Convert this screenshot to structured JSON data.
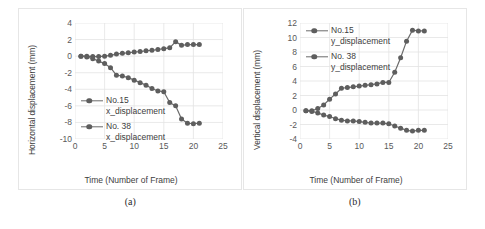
{
  "figure": {
    "captions": [
      "(a)",
      "(b)"
    ]
  },
  "chart_data": [
    {
      "type": "scatter",
      "panel": "a",
      "title": "",
      "xlabel": "Time (Number of Frame)",
      "ylabel": "Horizontal displacement (mm)",
      "xlim": [
        0,
        25
      ],
      "ylim": [
        -10,
        4
      ],
      "xticks": [
        0,
        5,
        10,
        15,
        20,
        25
      ],
      "yticks": [
        4,
        2,
        0,
        -2,
        -4,
        -6,
        -8,
        -10
      ],
      "grid": true,
      "legend_position": "inside-left",
      "marker": "circle",
      "line_color": "#6b6b6b",
      "marker_color": "#5e5e5e",
      "x": [
        1,
        2,
        3,
        4,
        5,
        6,
        7,
        8,
        9,
        10,
        11,
        12,
        13,
        14,
        15,
        16,
        17,
        18,
        19,
        20,
        21
      ],
      "series": [
        {
          "name": "No.15 x_displacement",
          "label_line1": "No.15",
          "label_line2": "x_displacement",
          "values": [
            0.0,
            0.0,
            -0.05,
            -0.05,
            0.0,
            0.1,
            0.25,
            0.35,
            0.4,
            0.5,
            0.55,
            0.65,
            0.7,
            0.8,
            0.9,
            1.0,
            1.75,
            1.3,
            1.4,
            1.4,
            1.4
          ]
        },
        {
          "name": "No. 38 x_displacement",
          "label_line1": "No. 38",
          "label_line2": "x_displacement",
          "values": [
            0.0,
            -0.1,
            -0.3,
            -0.6,
            -0.9,
            -1.4,
            -2.3,
            -2.4,
            -2.6,
            -2.9,
            -3.2,
            -3.5,
            -3.9,
            -4.2,
            -4.3,
            -5.6,
            -6.0,
            -7.6,
            -8.1,
            -8.15,
            -8.1
          ]
        }
      ]
    },
    {
      "type": "scatter",
      "panel": "b",
      "title": "",
      "xlabel": "Time (Number of Frame)",
      "ylabel": "Vertical displacement (mm)",
      "xlim": [
        0,
        25
      ],
      "ylim": [
        -4,
        12
      ],
      "xticks": [
        0,
        5,
        10,
        15,
        20,
        25
      ],
      "yticks": [
        12,
        10,
        8,
        6,
        4,
        2,
        0,
        -2,
        -4
      ],
      "grid": true,
      "legend_position": "inside-left",
      "marker": "circle",
      "line_color": "#6b6b6b",
      "marker_color": "#5e5e5e",
      "x": [
        1,
        2,
        3,
        4,
        5,
        6,
        7,
        8,
        9,
        10,
        11,
        12,
        13,
        14,
        15,
        16,
        17,
        18,
        19,
        20,
        21
      ],
      "series": [
        {
          "name": "No.15 y_displacement",
          "label_line1": "No.15",
          "label_line2": "y_displacement",
          "values": [
            -0.1,
            -0.1,
            0.2,
            0.7,
            1.5,
            2.2,
            3.0,
            3.1,
            3.2,
            3.3,
            3.4,
            3.5,
            3.6,
            3.8,
            3.8,
            5.2,
            7.2,
            9.5,
            11.0,
            10.9,
            10.9
          ]
        },
        {
          "name": "No. 38 y_displacement",
          "label_line1": "No. 38",
          "label_line2": "y_displacement",
          "values": [
            -0.1,
            -0.2,
            -0.4,
            -0.7,
            -0.9,
            -1.2,
            -1.4,
            -1.5,
            -1.5,
            -1.6,
            -1.7,
            -1.8,
            -1.8,
            -1.8,
            -1.9,
            -2.2,
            -2.5,
            -2.8,
            -2.9,
            -2.8,
            -2.8
          ]
        }
      ]
    }
  ]
}
